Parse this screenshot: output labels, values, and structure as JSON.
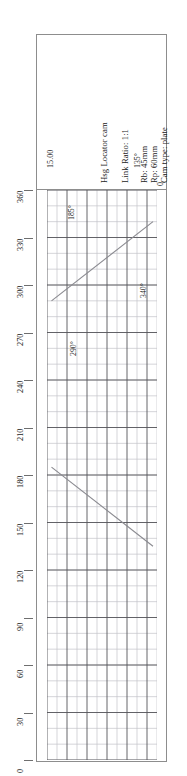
{
  "drawing": {
    "title_block": {
      "lines": [
        "Hsg Locator cam",
        "Link Ratio: 1:1",
        "Rb: 45mm",
        "Rp: 60mm",
        "Cam type: plate"
      ],
      "dimension_label": "15.00",
      "zero_label": "0"
    },
    "annotations": [
      {
        "label": "290°"
      },
      {
        "label": "340°"
      },
      {
        "label": "185°"
      },
      {
        "label": "135°"
      }
    ],
    "colors": {
      "frame": "#8d8d8d",
      "grid_major": "#55555a",
      "grid_minor": "#c3c3c8",
      "curve": "#8a8a90",
      "text": "#1a1a1a"
    }
  },
  "chart_data": {
    "type": "line",
    "title": "Hsg Locator cam",
    "xlabel": "",
    "ylabel": "Cam angle (degrees)",
    "ylim": [
      0,
      360
    ],
    "yticks": [
      0,
      30,
      60,
      90,
      120,
      150,
      180,
      210,
      240,
      270,
      300,
      330,
      360
    ],
    "ytick_labels": [
      "0",
      "30",
      "60",
      "90",
      "120",
      "150",
      "180",
      "210",
      "240",
      "270",
      "300",
      "330",
      "360"
    ],
    "xlim": [
      0,
      11
    ],
    "grid": true,
    "grid_minor_step_y": 10,
    "grid_major_step_y": 30,
    "legend": "none",
    "series": [
      {
        "name": "rise",
        "points": [
          [
            0.45,
            290
          ],
          [
            10.6,
            340
          ]
        ],
        "start_label": "290°",
        "end_label": "340°"
      },
      {
        "name": "fall",
        "points": [
          [
            0.45,
            185
          ],
          [
            10.6,
            135
          ]
        ],
        "start_label": "185°",
        "end_label": "135°"
      }
    ]
  }
}
